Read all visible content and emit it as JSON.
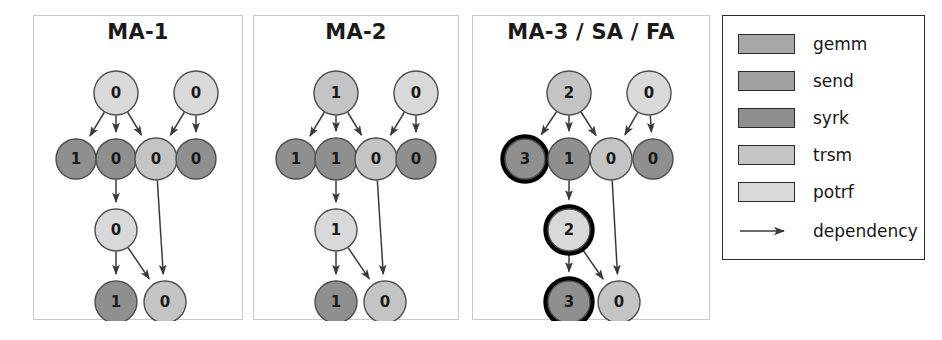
{
  "figure": {
    "width": 942,
    "height": 340,
    "background": "#ffffff"
  },
  "colors": {
    "gemm": "#a8a8a8",
    "send": "#a0a0a0",
    "syrk": "#8f8f8f",
    "trsm": "#c4c4c4",
    "potrf": "#d9d9d9",
    "node_stroke": "#4d4d4d",
    "highlight_stroke": "#000000",
    "edge": "#3a3a3a",
    "panel_border": "#c9c9c9",
    "legend_border": "#2a2a2a",
    "text": "#1a1a1a"
  },
  "panels": [
    {
      "id": "ma-1",
      "title": "MA-1",
      "box": {
        "x": 33,
        "y": 15,
        "w": 210,
        "h": 305
      },
      "nodes": [
        {
          "id": "n0",
          "label": "0",
          "x": 82,
          "y": 77,
          "r": 22,
          "fill": "potrf",
          "ring": false
        },
        {
          "id": "n1",
          "label": "0",
          "x": 162,
          "y": 77,
          "r": 22,
          "fill": "potrf",
          "ring": false
        },
        {
          "id": "n2",
          "label": "1",
          "x": 42,
          "y": 143,
          "r": 20,
          "fill": "syrk",
          "ring": false
        },
        {
          "id": "n3",
          "label": "0",
          "x": 82,
          "y": 143,
          "r": 20,
          "fill": "syrk",
          "ring": false
        },
        {
          "id": "n4",
          "label": "0",
          "x": 122,
          "y": 143,
          "r": 21,
          "fill": "trsm",
          "ring": false
        },
        {
          "id": "n5",
          "label": "0",
          "x": 162,
          "y": 143,
          "r": 20,
          "fill": "syrk",
          "ring": false
        },
        {
          "id": "n6",
          "label": "0",
          "x": 82,
          "y": 214,
          "r": 21,
          "fill": "potrf",
          "ring": false
        },
        {
          "id": "n7",
          "label": "1",
          "x": 82,
          "y": 286,
          "r": 21,
          "fill": "syrk",
          "ring": false
        },
        {
          "id": "n8",
          "label": "0",
          "x": 131,
          "y": 286,
          "r": 21,
          "fill": "trsm",
          "ring": false
        }
      ],
      "edges": [
        [
          "n0",
          "n2"
        ],
        [
          "n0",
          "n3"
        ],
        [
          "n0",
          "n4"
        ],
        [
          "n1",
          "n4"
        ],
        [
          "n1",
          "n5"
        ],
        [
          "n3",
          "n6"
        ],
        [
          "n6",
          "n7"
        ],
        [
          "n6",
          "n8"
        ],
        [
          "n4",
          "n8"
        ]
      ]
    },
    {
      "id": "ma-2",
      "title": "MA-2",
      "box": {
        "x": 253,
        "y": 15,
        "w": 206,
        "h": 305
      },
      "nodes": [
        {
          "id": "n0",
          "label": "1",
          "x": 82,
          "y": 77,
          "r": 22,
          "fill": "trsm",
          "ring": false
        },
        {
          "id": "n1",
          "label": "0",
          "x": 162,
          "y": 77,
          "r": 22,
          "fill": "potrf",
          "ring": false
        },
        {
          "id": "n2",
          "label": "1",
          "x": 42,
          "y": 143,
          "r": 20,
          "fill": "syrk",
          "ring": false
        },
        {
          "id": "n3",
          "label": "1",
          "x": 82,
          "y": 143,
          "r": 21,
          "fill": "syrk",
          "ring": false
        },
        {
          "id": "n4",
          "label": "0",
          "x": 122,
          "y": 143,
          "r": 21,
          "fill": "trsm",
          "ring": false
        },
        {
          "id": "n5",
          "label": "0",
          "x": 162,
          "y": 143,
          "r": 20,
          "fill": "syrk",
          "ring": false
        },
        {
          "id": "n6",
          "label": "1",
          "x": 82,
          "y": 214,
          "r": 21,
          "fill": "potrf",
          "ring": false
        },
        {
          "id": "n7",
          "label": "1",
          "x": 82,
          "y": 286,
          "r": 21,
          "fill": "syrk",
          "ring": false
        },
        {
          "id": "n8",
          "label": "0",
          "x": 131,
          "y": 286,
          "r": 21,
          "fill": "trsm",
          "ring": false
        }
      ],
      "edges": [
        [
          "n0",
          "n2"
        ],
        [
          "n0",
          "n3"
        ],
        [
          "n0",
          "n4"
        ],
        [
          "n1",
          "n4"
        ],
        [
          "n1",
          "n5"
        ],
        [
          "n3",
          "n6"
        ],
        [
          "n6",
          "n7"
        ],
        [
          "n6",
          "n8"
        ],
        [
          "n4",
          "n8"
        ]
      ]
    },
    {
      "id": "ma-3-sa-fa",
      "title": "MA-3 / SA / FA",
      "box": {
        "x": 472,
        "y": 15,
        "w": 238,
        "h": 305
      },
      "nodes": [
        {
          "id": "n0",
          "label": "2",
          "x": 96,
          "y": 77,
          "r": 22,
          "fill": "trsm",
          "ring": false
        },
        {
          "id": "n1",
          "label": "0",
          "x": 176,
          "y": 77,
          "r": 22,
          "fill": "potrf",
          "ring": false
        },
        {
          "id": "n2",
          "label": "3",
          "x": 52,
          "y": 143,
          "r": 20,
          "fill": "syrk",
          "ring": true
        },
        {
          "id": "n3",
          "label": "1",
          "x": 96,
          "y": 143,
          "r": 21,
          "fill": "syrk",
          "ring": false
        },
        {
          "id": "n4",
          "label": "0",
          "x": 138,
          "y": 143,
          "r": 21,
          "fill": "trsm",
          "ring": false
        },
        {
          "id": "n5",
          "label": "0",
          "x": 180,
          "y": 143,
          "r": 20,
          "fill": "syrk",
          "ring": false
        },
        {
          "id": "n6",
          "label": "2",
          "x": 96,
          "y": 214,
          "r": 21,
          "fill": "potrf",
          "ring": true
        },
        {
          "id": "n7",
          "label": "3",
          "x": 96,
          "y": 286,
          "r": 21,
          "fill": "syrk",
          "ring": true
        },
        {
          "id": "n8",
          "label": "0",
          "x": 146,
          "y": 286,
          "r": 21,
          "fill": "trsm",
          "ring": false
        }
      ],
      "edges": [
        [
          "n0",
          "n2"
        ],
        [
          "n0",
          "n3"
        ],
        [
          "n0",
          "n4"
        ],
        [
          "n1",
          "n4"
        ],
        [
          "n1",
          "n5"
        ],
        [
          "n3",
          "n6"
        ],
        [
          "n6",
          "n7"
        ],
        [
          "n6",
          "n8"
        ],
        [
          "n4",
          "n8"
        ]
      ]
    }
  ],
  "legend": {
    "box": {
      "x": 722,
      "y": 15,
      "w": 203,
      "h": 245
    },
    "items": [
      {
        "label": "gemm",
        "color_key": "gemm"
      },
      {
        "label": "send",
        "color_key": "send"
      },
      {
        "label": "syrk",
        "color_key": "syrk"
      },
      {
        "label": "trsm",
        "color_key": "trsm"
      },
      {
        "label": "potrf",
        "color_key": "potrf"
      }
    ],
    "dependency": {
      "label": "dependency",
      "icon": "arrow-right-icon"
    }
  },
  "chart_data": {
    "type": "diagram",
    "legend_entries": [
      "gemm",
      "send",
      "syrk",
      "trsm",
      "potrf",
      "dependency"
    ],
    "panel_titles": [
      "MA-1",
      "MA-2",
      "MA-3 / SA / FA"
    ],
    "node_labels_by_panel": {
      "MA-1": [
        "0",
        "0",
        "1",
        "0",
        "0",
        "0",
        "0",
        "1",
        "0"
      ],
      "MA-2": [
        "1",
        "0",
        "1",
        "1",
        "0",
        "0",
        "1",
        "1",
        "0"
      ],
      "MA-3 / SA / FA": [
        "2",
        "0",
        "3",
        "1",
        "0",
        "0",
        "2",
        "3",
        "0"
      ]
    },
    "highlighted_nodes": {
      "MA-1": [],
      "MA-2": [],
      "MA-3 / SA / FA": [
        "3",
        "2",
        "3"
      ]
    }
  }
}
